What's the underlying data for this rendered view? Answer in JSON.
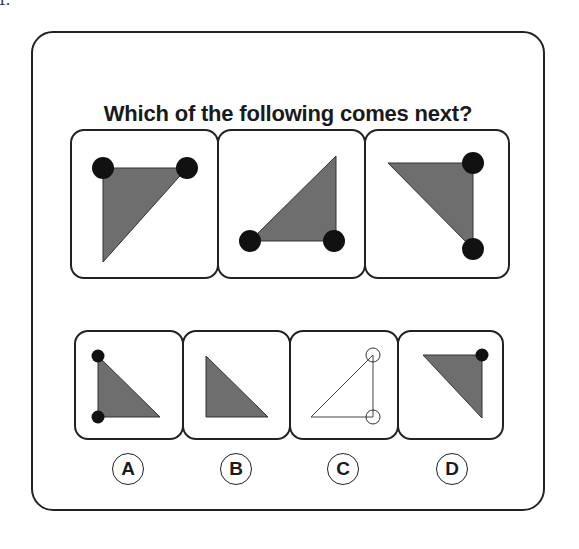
{
  "question": {
    "number": "1.",
    "title": "Which of the following comes next?"
  },
  "colors": {
    "triangle_fill": "#6e6e6e",
    "dot_fill": "#111111",
    "border": "#222222",
    "background": "#ffffff"
  },
  "sequence": [
    {
      "position": 1,
      "description": "grey right triangle, right angle top-left, black dots at top-left and top-right"
    },
    {
      "position": 2,
      "description": "grey right triangle, right angle bottom-right, black dots at bottom-left and bottom-right"
    },
    {
      "position": 3,
      "description": "grey right triangle, right angle top-right, black dots at top-right and bottom-right"
    }
  ],
  "options": [
    {
      "label": "A",
      "description": "grey right triangle, right angle bottom-left, black dots at top-left and bottom-left"
    },
    {
      "label": "B",
      "description": "grey right triangle, right angle bottom-left, no dots"
    },
    {
      "label": "C",
      "description": "outlined white triangle, right angle bottom-right, hollow circles at top-right and bottom-right"
    },
    {
      "label": "D",
      "description": "grey right triangle, right angle top-right, one black dot at top-right"
    }
  ]
}
